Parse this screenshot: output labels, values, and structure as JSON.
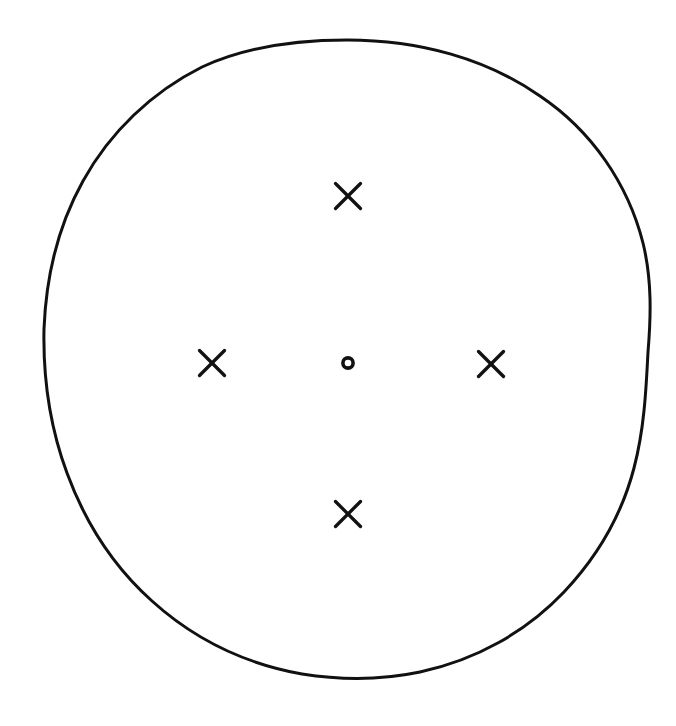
{
  "figure": {
    "title": "Hand-drawn circle with cross-arranged X markers",
    "background_color": "#ffffff",
    "ink_color": "#111111",
    "width": 676,
    "height": 726,
    "style": "hand-drawn line art"
  },
  "chart_data": {
    "type": "scatter",
    "title": "",
    "xlabel": "",
    "ylabel": "",
    "xlim": [
      0,
      676
    ],
    "ylim": [
      0,
      726
    ],
    "grid": false,
    "legend": "none",
    "boundary": {
      "shape": "circle",
      "label": "outer-circle",
      "center_x": 347,
      "center_y": 359,
      "radius_x": 303,
      "radius_y": 319,
      "stroke_color": "#111111",
      "stroke_width": 3,
      "fill": "none"
    },
    "points": [
      {
        "label": "center",
        "marker": "o",
        "x": 348,
        "y": 363,
        "size": 11
      },
      {
        "label": "north",
        "marker": "x",
        "x": 348,
        "y": 196,
        "size": 26
      },
      {
        "label": "west",
        "marker": "x",
        "x": 212,
        "y": 363,
        "size": 26
      },
      {
        "label": "east",
        "marker": "x",
        "x": 491,
        "y": 364,
        "size": 26
      },
      {
        "label": "south",
        "marker": "x",
        "x": 348,
        "y": 514,
        "size": 26
      }
    ],
    "marker_counts": {
      "x": 4,
      "o": 1
    }
  }
}
